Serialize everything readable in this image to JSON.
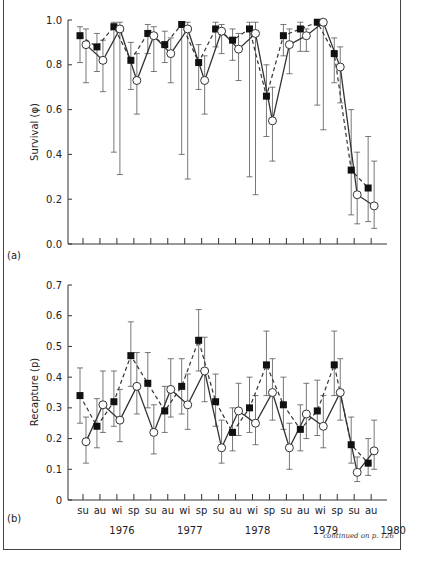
{
  "chart_data": [
    {
      "type": "line",
      "panel_label": "(a)",
      "ylabel": "Survival (φ)",
      "xlabel": "",
      "ylim": [
        0,
        1.0
      ],
      "yticks": [
        "0.0",
        "0.2",
        "0.4",
        "0.6",
        "0.8",
        "1.0"
      ],
      "grid": false,
      "legend": null,
      "x": [
        "su",
        "au",
        "wi",
        "sp",
        "su",
        "au",
        "wi",
        "sp",
        "su",
        "au",
        "wi",
        "sp",
        "su",
        "au",
        "wi",
        "sp",
        "su",
        "au"
      ],
      "series": [
        {
          "name": "filled squares (dashed)",
          "marker": "square-filled",
          "line": "dashed",
          "values": [
            0.93,
            0.88,
            0.97,
            0.82,
            0.94,
            0.89,
            0.98,
            0.81,
            0.96,
            0.91,
            0.96,
            0.66,
            0.93,
            0.96,
            0.99,
            0.85,
            0.33,
            0.25
          ],
          "ci_low": [
            0.81,
            0.77,
            0.41,
            0.69,
            0.85,
            0.81,
            0.4,
            0.69,
            0.88,
            0.82,
            0.3,
            0.48,
            0.84,
            0.86,
            0.62,
            0.72,
            0.13,
            0.1
          ],
          "ci_high": [
            0.97,
            0.94,
            0.99,
            0.9,
            0.98,
            0.95,
            0.99,
            0.89,
            0.99,
            0.96,
            0.99,
            0.8,
            0.98,
            0.99,
            1.0,
            0.92,
            0.6,
            0.48
          ]
        },
        {
          "name": "open circles (solid)",
          "marker": "circle-open",
          "line": "solid",
          "values": [
            0.89,
            0.82,
            0.96,
            0.73,
            0.93,
            0.85,
            0.96,
            0.73,
            0.95,
            0.87,
            0.94,
            0.55,
            0.89,
            0.93,
            0.99,
            0.79,
            0.22,
            0.17
          ],
          "ci_low": [
            0.72,
            0.68,
            0.31,
            0.58,
            0.77,
            0.72,
            0.29,
            0.58,
            0.85,
            0.73,
            0.22,
            0.37,
            0.76,
            0.86,
            0.51,
            0.63,
            0.09,
            0.07
          ],
          "ci_high": [
            0.96,
            0.91,
            0.99,
            0.85,
            0.97,
            0.92,
            0.99,
            0.84,
            0.98,
            0.94,
            0.99,
            0.7,
            0.96,
            0.96,
            1.0,
            0.88,
            0.41,
            0.37
          ]
        }
      ]
    },
    {
      "type": "line",
      "panel_label": "(b)",
      "ylabel": "Recapture (p)",
      "xlabel": "",
      "ylim": [
        0,
        0.7
      ],
      "yticks": [
        "0",
        "0.1",
        "0.2",
        "0.3",
        "0.4",
        "0.5",
        "0.6",
        "0.7"
      ],
      "grid": false,
      "legend": null,
      "x": [
        "su",
        "au",
        "wi",
        "sp",
        "su",
        "au",
        "wi",
        "sp",
        "su",
        "au",
        "wi",
        "sp",
        "su",
        "au",
        "wi",
        "sp",
        "su",
        "au"
      ],
      "year_labels": [
        "1976",
        "1977",
        "1978",
        "1979",
        "1980"
      ],
      "series": [
        {
          "name": "filled squares (dashed)",
          "marker": "square-filled",
          "line": "dashed",
          "values": [
            0.34,
            0.24,
            0.32,
            0.47,
            0.38,
            0.29,
            0.37,
            0.52,
            0.32,
            0.22,
            0.3,
            0.44,
            0.31,
            0.23,
            0.29,
            0.44,
            0.18,
            0.12
          ],
          "ci_low": [
            0.25,
            0.17,
            0.24,
            0.37,
            0.3,
            0.22,
            0.28,
            0.42,
            0.24,
            0.16,
            0.22,
            0.34,
            0.23,
            0.16,
            0.21,
            0.34,
            0.12,
            0.08
          ],
          "ci_high": [
            0.43,
            0.33,
            0.42,
            0.58,
            0.48,
            0.37,
            0.46,
            0.62,
            0.41,
            0.3,
            0.4,
            0.55,
            0.4,
            0.31,
            0.39,
            0.55,
            0.27,
            0.2
          ]
        },
        {
          "name": "open circles (solid)",
          "marker": "circle-open",
          "line": "solid",
          "values": [
            0.19,
            0.31,
            0.26,
            0.37,
            0.22,
            0.36,
            0.31,
            0.42,
            0.17,
            0.29,
            0.25,
            0.35,
            0.17,
            0.28,
            0.24,
            0.35,
            0.09,
            0.16
          ],
          "ci_low": [
            0.12,
            0.22,
            0.19,
            0.28,
            0.15,
            0.27,
            0.23,
            0.32,
            0.12,
            0.21,
            0.18,
            0.26,
            0.1,
            0.2,
            0.17,
            0.26,
            0.06,
            0.1
          ],
          "ci_high": [
            0.27,
            0.42,
            0.36,
            0.48,
            0.31,
            0.46,
            0.41,
            0.53,
            0.26,
            0.38,
            0.34,
            0.46,
            0.25,
            0.38,
            0.34,
            0.46,
            0.14,
            0.26
          ]
        }
      ]
    }
  ],
  "footer": {
    "text": "continued on p. 126"
  }
}
